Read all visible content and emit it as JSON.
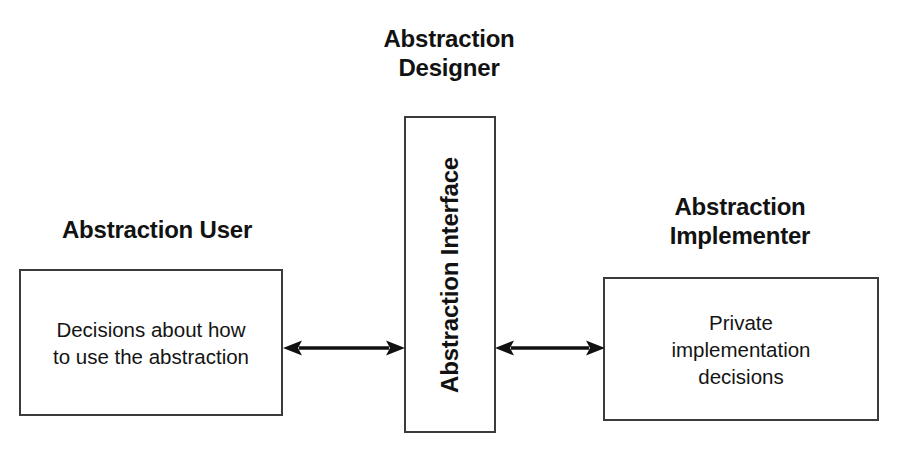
{
  "diagram": {
    "title": "Abstraction\nDesigner",
    "background_color": "#ffffff",
    "line_color": "#3b3b3b",
    "text_color": "#121212"
  },
  "nodes": {
    "user": {
      "heading": "Abstraction User",
      "body": "Decisions about how\nto use the abstraction"
    },
    "interface": {
      "body": "Abstraction Interface",
      "orientation": "vertical"
    },
    "implementer": {
      "heading": "Abstraction\nImplementer",
      "body": "Private\nimplementation\ndecisions"
    }
  },
  "connectors": [
    {
      "name": "user-to-interface",
      "from": "user",
      "to": "interface",
      "style": "double-headed-arrow"
    },
    {
      "name": "interface-to-implementer",
      "from": "interface",
      "to": "implementer",
      "style": "double-headed-arrow"
    }
  ]
}
